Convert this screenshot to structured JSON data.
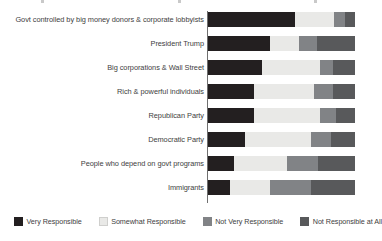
{
  "chart_data": {
    "type": "bar",
    "orientation": "horizontal",
    "stacked": true,
    "normalized": true,
    "title": "",
    "subtitle": "",
    "xlabel": "",
    "ylabel": "",
    "xlim": [
      0,
      100
    ],
    "grid": false,
    "legend_position": "bottom",
    "categories": [
      "Govt controlled by big money donors & corporate lobbyists",
      "President Trump",
      "Big corporations & Wall Street",
      "Rich & powerful individuals",
      "Republican Party",
      "Democratic Party",
      "People who depend on govt programs",
      "Immigrants"
    ],
    "series": [
      {
        "name": "Very Responsible",
        "color": "#231f20",
        "values": [
          59,
          42,
          37,
          31,
          31,
          25,
          18,
          15
        ]
      },
      {
        "name": "Somewhat Responsible",
        "color": "#e9e9e7",
        "values": [
          27,
          20,
          39,
          41,
          45,
          45,
          36,
          27
        ]
      },
      {
        "name": "Not Very Responsible",
        "color": "#818386",
        "values": [
          7,
          12,
          9,
          13,
          11,
          14,
          21,
          28
        ]
      },
      {
        "name": "Not Responsible at All",
        "color": "#58595b",
        "values": [
          7,
          26,
          15,
          15,
          13,
          16,
          25,
          30
        ]
      }
    ]
  },
  "legend": {
    "items": [
      {
        "label": "Very Responsible",
        "color": "#231f20"
      },
      {
        "label": "Somewhat Responsible",
        "color": "#e9e9e7"
      },
      {
        "label": "Not Very Responsible",
        "color": "#818386"
      },
      {
        "label": "Not Responsible at All",
        "color": "#58595b"
      }
    ]
  }
}
